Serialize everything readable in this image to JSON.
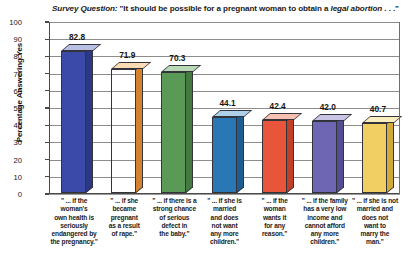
{
  "chart_data": {
    "type": "bar",
    "title": "Survey Question: \"It should be possible for a pregnant woman to obtain a legal abortion . . .\"",
    "title_parts": {
      "lead_italic": "Survey Question:",
      "plain_1": " \"It should be possible for a pregnant woman to obtain a ",
      "mid_italic": "legal abortion",
      "plain_2": " . . .\""
    },
    "xlabel": "",
    "ylabel": "Percentage Answering Yes",
    "ylim": [
      0,
      100
    ],
    "ytick_step": 10,
    "yticks": [
      100,
      90,
      80,
      70,
      60,
      50,
      40,
      30,
      20,
      10,
      0
    ],
    "grid": true,
    "legend": "none",
    "categories": [
      "\" ... if the woman's own health is seriously endangered by the pregnancy.\"",
      "\" ... if she became pregnant as a result of rape.\"",
      "\" ... if there is a strong chance of serious defect in the baby.\"",
      "\" ... if she is married and does not want any more children.\"",
      "\" ... if the woman wants it for any reason.\"",
      "\" ... if the family has a very low income and cannot afford any more children.\"",
      "\" ... if she is not married and does not want to marry the man.\""
    ],
    "category_lines": [
      [
        "\" ... if the",
        "woman's",
        "own health is",
        "seriously",
        "endangered by",
        "the pregnancy.\""
      ],
      [
        "\" ... if she",
        "became",
        "pregnant",
        "as a result",
        "of rape.\""
      ],
      [
        "\" ... if there is a",
        "strong chance",
        "of serious",
        "defect in",
        "the baby.\""
      ],
      [
        "\" ... if she is",
        "married",
        "and does",
        "not want",
        "any more",
        "children.\""
      ],
      [
        "\" ... if the",
        "woman",
        "wants it",
        "for any",
        "reason.\""
      ],
      [
        "\" ... if the family",
        "has a very low",
        "income and",
        "cannot afford",
        "any more",
        "children.\""
      ],
      [
        "\" ... if she is not",
        "married and",
        "does not",
        "want to",
        "marry the",
        "man.\""
      ]
    ],
    "values": [
      82.8,
      71.9,
      70.3,
      44.1,
      42.4,
      42.0,
      40.7
    ],
    "value_labels": [
      "82.8",
      "71.9",
      "70.3",
      "44.1",
      "42.4",
      "42.0",
      "40.7"
    ],
    "bar_colors": [
      "#3b4aa8",
      "#f5a council",
      "#5a9a56",
      "#2a77b5",
      "#e8553a",
      "#6f66b3",
      "#f2cf62"
    ],
    "series_colors": {
      "bar_1_front": "#3b4aa8",
      "bar_1_side": "#2c3884",
      "bar_1_top": "#b9c0e4",
      "bar_2_front": "#f5a košt",
      "bar_2_side": "#d4822f",
      "bar_2_top": "#fbdcb4",
      "bar_3_front": "#5a9a56",
      "bar_3_side": "#447a42",
      "bar_3_top": "#b9d9b6",
      "bar_4_front": "#2a77b5",
      "bar_4_side": "#1e5d90",
      "bar_4_top": "#aed0e8",
      "bar_5_front": "#e8553a",
      "bar_5_side": "#bf3f28",
      "bar_5_top": "#f7c0b0",
      "bar_6_front": "#6f66b3",
      "bar_6_side": "#554d91",
      "bar_6_top": "#cac5e5",
      "bar_7_front": "#f2cf62",
      "bar_7_side": "#d2aa3c",
      "bar_7_top": "#faedbe"
    }
  }
}
